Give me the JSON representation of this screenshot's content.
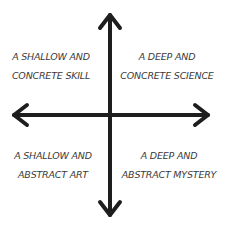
{
  "diagram": {
    "type": "quadrant",
    "colors": {
      "axis": "#1e1e1e",
      "text": "#3a3a3a",
      "background": "#ffffff"
    },
    "quadrants": {
      "top_left": {
        "line1": "A SHALLOW AND",
        "line2": "CONCRETE SKILL"
      },
      "top_right": {
        "line1": "A DEEP AND",
        "line2": "CONCRETE SCIENCE"
      },
      "bottom_left": {
        "line1": "A SHALLOW AND",
        "line2": "ABSTRACT ART"
      },
      "bottom_right": {
        "line1": "A DEEP AND",
        "line2": "ABSTRACT MYSTERY"
      }
    }
  }
}
